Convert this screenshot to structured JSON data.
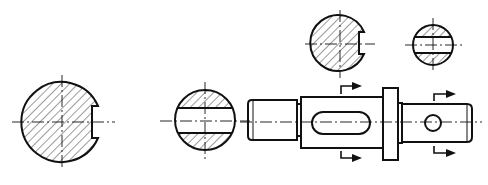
{
  "drawing": {
    "type": "mechanical-drawing",
    "subject": "Stepped shaft with sectional views",
    "line_color": "#111111",
    "background": "#ffffff",
    "section_views": [
      {
        "id": "section-large-keyway",
        "cx": 62,
        "cy": 122,
        "r": 40,
        "feature": "keyway slot (right)",
        "hatched": true
      },
      {
        "id": "section-flats-left",
        "cx": 205,
        "cy": 120,
        "r": 30,
        "feature": "through slot (flat band)",
        "hatched": true
      },
      {
        "id": "section-top-keyway",
        "cx": 340,
        "cy": 42,
        "r": 28,
        "feature": "keyway slot (right)",
        "hatched": true
      },
      {
        "id": "section-top-flats",
        "cx": 433,
        "cy": 45,
        "r": 20,
        "feature": "cross hole (flat band)",
        "hatched": true
      }
    ],
    "shaft": {
      "segments": [
        {
          "name": "threaded-end",
          "x1": 248,
          "x2": 298,
          "y1": 100,
          "y2": 140
        },
        {
          "name": "main-body",
          "x1": 300,
          "x2": 382,
          "y1": 97,
          "y2": 148
        },
        {
          "name": "collar",
          "x1": 382,
          "x2": 398,
          "y1": 88,
          "y2": 160
        },
        {
          "name": "right-end",
          "x1": 398,
          "x2": 472,
          "y1": 104,
          "y2": 142
        }
      ],
      "features": [
        {
          "name": "slot",
          "x1": 312,
          "x2": 370,
          "cy": 123,
          "h": 22
        },
        {
          "name": "cross-hole",
          "cx": 433,
          "cy": 123,
          "r": 8
        }
      ]
    },
    "section_markers": [
      {
        "name": "cut-mark-1",
        "x": 341,
        "top_y": 86,
        "bottom_y": 157,
        "direction": "right"
      },
      {
        "name": "cut-mark-2",
        "x": 434,
        "top_y": 95,
        "bottom_y": 153,
        "direction": "right"
      }
    ]
  }
}
